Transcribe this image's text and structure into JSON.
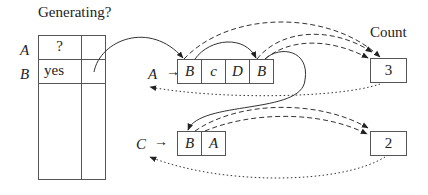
{
  "table": {
    "title": "Generating?",
    "rows": [
      {
        "label": "A",
        "value": "?"
      },
      {
        "label": "B",
        "value": "yes"
      }
    ]
  },
  "lists": [
    {
      "name": "A",
      "cells": [
        "B",
        "c",
        "D",
        "B"
      ],
      "count_label": "Count",
      "count": "3"
    },
    {
      "name": "C",
      "cells": [
        "B",
        "A"
      ],
      "count": "2"
    }
  ],
  "arrow_symbol": "→"
}
